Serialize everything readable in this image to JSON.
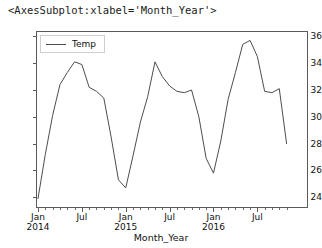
{
  "figure": {
    "repr_text": "<AxesSubplot:xlabel='Month_Year'>",
    "line_color": "#4d4d4d",
    "axes_color": "#5a5a5a",
    "background": "#ffffff"
  },
  "legend": {
    "entries": [
      {
        "label": "Temp",
        "color": "#4d4d4d",
        "marker": "line"
      }
    ],
    "position": "upper left"
  },
  "chart_data": {
    "type": "line",
    "title": "",
    "xlabel": "Month_Year",
    "ylabel": "",
    "grid": false,
    "legend_position": "upper left",
    "ylim": [
      23.2,
      36.4
    ],
    "yticks": [
      24,
      26,
      28,
      30,
      32,
      34,
      36
    ],
    "ytick_labels": [
      "24",
      "26",
      "28",
      "30",
      "32",
      "34",
      "36"
    ],
    "xtick_labels": [
      "Jan\n2014",
      "Jul",
      "Jan\n2015",
      "Jul",
      "Jan\n2016",
      "Jul"
    ],
    "xtick_positions": [
      0,
      6,
      12,
      18,
      24,
      30
    ],
    "x_minor_interval_months": 1,
    "x": [
      "Jan 2014",
      "Feb 2014",
      "Mar 2014",
      "Apr 2014",
      "May 2014",
      "Jun 2014",
      "Jul 2014",
      "Aug 2014",
      "Sep 2014",
      "Oct 2014",
      "Nov 2014",
      "Dec 2014",
      "Jan 2015",
      "Feb 2015",
      "Mar 2015",
      "Apr 2015",
      "May 2015",
      "Jun 2015",
      "Jul 2015",
      "Aug 2015",
      "Sep 2015",
      "Oct 2015",
      "Nov 2015",
      "Dec 2015",
      "Jan 2016",
      "Feb 2016",
      "Mar 2016",
      "Apr 2016",
      "May 2016",
      "Jun 2016",
      "Jul 2016",
      "Aug 2016",
      "Sep 2016",
      "Oct 2016",
      "Nov 2016"
    ],
    "series": [
      {
        "name": "Temp",
        "color": "#4d4d4d",
        "values": [
          23.9,
          27.2,
          30.1,
          32.4,
          33.3,
          34.1,
          33.9,
          32.2,
          31.9,
          31.4,
          28.5,
          25.3,
          24.7,
          27.1,
          29.6,
          31.5,
          34.1,
          33.0,
          32.3,
          31.9,
          31.8,
          32.0,
          30.0,
          26.9,
          25.8,
          28.2,
          31.3,
          33.3,
          35.4,
          35.7,
          34.5,
          31.9,
          31.8,
          32.1,
          28.0
        ]
      }
    ]
  }
}
